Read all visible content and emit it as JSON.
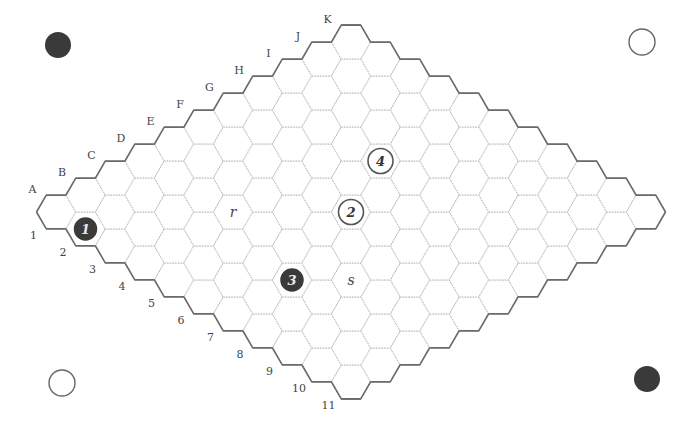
{
  "board": {
    "size": 11,
    "origin": {
      "x": 56,
      "y": 212
    },
    "step": {
      "dx": 29.5,
      "dy": 17
    },
    "hex_radius": 19.5,
    "letters": [
      "A",
      "B",
      "C",
      "D",
      "E",
      "F",
      "G",
      "H",
      "I",
      "J",
      "K"
    ],
    "numbers": [
      "1",
      "2",
      "3",
      "4",
      "5",
      "6",
      "7",
      "8",
      "9",
      "10",
      "11"
    ]
  },
  "stones": [
    {
      "id": "1",
      "label": "1",
      "color": "black",
      "cell": "A2"
    },
    {
      "id": "2",
      "label": "2",
      "color": "white",
      "cell": "F6"
    },
    {
      "id": "3",
      "label": "3",
      "color": "black",
      "cell": "C7"
    },
    {
      "id": "4",
      "label": "4",
      "color": "white",
      "cell": "H5"
    }
  ],
  "marks": [
    {
      "label": "r",
      "cell": "D4"
    },
    {
      "label": "s",
      "cell": "D8"
    }
  ],
  "corner_markers": [
    {
      "position": "top-left",
      "color": "black",
      "x": 58,
      "y": 45
    },
    {
      "position": "top-right",
      "color": "white",
      "x": 642,
      "y": 42
    },
    {
      "position": "bottom-left",
      "color": "white",
      "x": 62,
      "y": 383
    },
    {
      "position": "bottom-right",
      "color": "black",
      "x": 647,
      "y": 379
    }
  ],
  "colors": {
    "black_stone": "#3a3a3a",
    "border": "#6a6a6a",
    "grid": "#bdbdbd"
  }
}
